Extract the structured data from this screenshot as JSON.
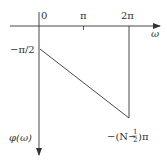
{
  "diagram": {
    "type": "phase-response-plot",
    "axes": {
      "x_label": "ω",
      "y_label": "φ(ω)",
      "x_ticks": [
        "0",
        "π",
        "2π"
      ],
      "origin_label": "0"
    },
    "annotations": {
      "start_value": "−π/2",
      "end_value_prefix": "−(N−",
      "end_value_frac_num": "1",
      "end_value_frac_den": "2",
      "end_value_suffix": ")π"
    },
    "line": {
      "from": {
        "x": "0",
        "y": "−π/2"
      },
      "to": {
        "x": "2π",
        "y": "−(N−1/2)π"
      }
    },
    "colors": {
      "stroke": "#333333",
      "background": "#ffffff"
    }
  }
}
